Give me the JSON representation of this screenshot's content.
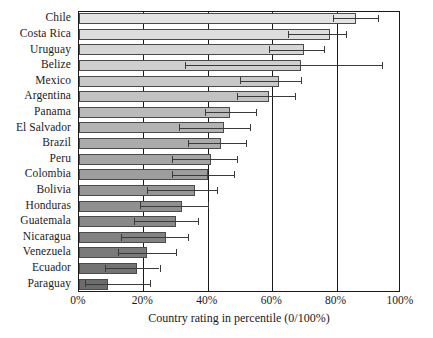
{
  "chart_data": {
    "type": "bar",
    "orientation": "horizontal",
    "title": "",
    "xlabel": "Country rating in percentile (0/100%)",
    "ylabel": "",
    "xlim": [
      0,
      100
    ],
    "xticks": [
      "0%",
      "20%",
      "40%",
      "60%",
      "80%",
      "100%"
    ],
    "xtick_values": [
      0,
      20,
      40,
      60,
      80,
      100
    ],
    "grid": "vertical",
    "legend": "none",
    "categories": [
      "Chile",
      "Costa Rica",
      "Uruguay",
      "Belize",
      "Mexico",
      "Argentina",
      "Panama",
      "El Salvador",
      "Brazil",
      "Peru",
      "Colombia",
      "Bolivia",
      "Honduras",
      "Guatemala",
      "Nicaragua",
      "Venezuela",
      "Ecuador",
      "Paraguay"
    ],
    "values": [
      86,
      78,
      70,
      69,
      62,
      59,
      47,
      45,
      44,
      41,
      40,
      36,
      32,
      30,
      27,
      21,
      18,
      9
    ],
    "error_low": [
      79,
      65,
      59,
      33,
      50,
      49,
      39,
      31,
      34,
      29,
      29,
      21,
      19,
      17,
      13,
      12,
      8,
      2
    ],
    "error_high": [
      93,
      83,
      76,
      94,
      69,
      67,
      55,
      53,
      52,
      49,
      48,
      43,
      40,
      37,
      34,
      30,
      25,
      22
    ],
    "bar_colors": [
      "#e3e3e3",
      "#dedede",
      "#d6d6d6",
      "#cfcfcf",
      "#c8c8c8",
      "#c2c2c2",
      "#bababa",
      "#b3b3b3",
      "#ababab",
      "#a5a5a5",
      "#9e9e9e",
      "#969696",
      "#909090",
      "#898989",
      "#828282",
      "#7a7a7a",
      "#737373",
      "#6c6c6c"
    ]
  },
  "axis": {
    "xlabel": "Country rating in percentile (0/100%)"
  },
  "footnote": ""
}
